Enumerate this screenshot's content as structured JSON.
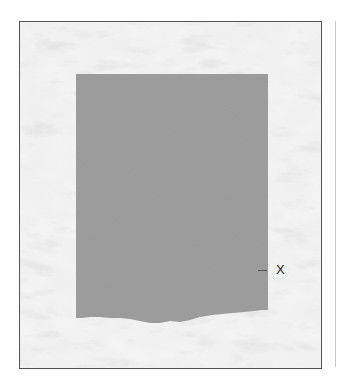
{
  "figure": {
    "background": "marble-texture",
    "frame_border_color": "#555555",
    "specimen": {
      "shape": "rectangle-with-torn-bottom-edge",
      "fill_color": "#9a9a9a"
    },
    "labels": [
      {
        "text": "X",
        "position": "right-of-specimen-lower"
      }
    ]
  }
}
